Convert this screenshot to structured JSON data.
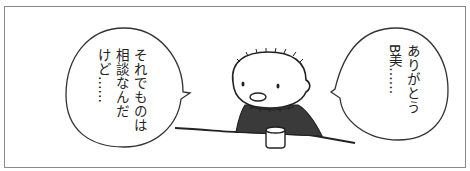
{
  "panel": {
    "frame_color": "#8a8a8a",
    "shirt_color": "#3a3a3a",
    "line_color": "#222222"
  },
  "bubbles": [
    {
      "position": "left",
      "speaker_direction": "right",
      "lines": [
        "それでものは",
        "相談なんだ",
        "けど……"
      ]
    },
    {
      "position": "right",
      "speaker_direction": "left",
      "lines": [
        "ありがとう",
        "B美……"
      ]
    }
  ],
  "character": {
    "description": "bald round-headed character with stitched hairline, dark shirt, seated at table with cup"
  }
}
